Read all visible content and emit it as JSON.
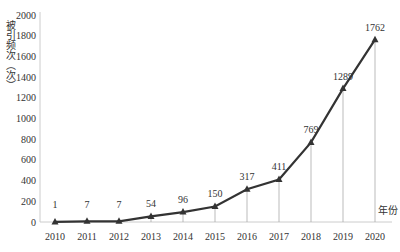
{
  "chart_data": {
    "type": "line",
    "title": "",
    "xlabel": "年份",
    "ylabel": "被引频次（次）",
    "categories": [
      "2010",
      "2011",
      "2012",
      "2013",
      "2014",
      "2015",
      "2016",
      "2017",
      "2018",
      "2019",
      "2020"
    ],
    "series": [
      {
        "name": "被引频次",
        "values": [
          1,
          7,
          7,
          54,
          96,
          150,
          317,
          411,
          769,
          1289,
          1762
        ]
      }
    ],
    "data_labels": [
      "1",
      "7",
      "7",
      "54",
      "96",
      "150",
      "317",
      "411",
      "769",
      "1289",
      "1762"
    ],
    "yticks": [
      0,
      200,
      400,
      600,
      800,
      1000,
      1200,
      1400,
      1600,
      1800,
      2000
    ],
    "ylim": [
      0,
      2000
    ],
    "grid": false,
    "marker": "triangle",
    "drop_lines": true,
    "line_color": "#333333",
    "legend": "none"
  }
}
